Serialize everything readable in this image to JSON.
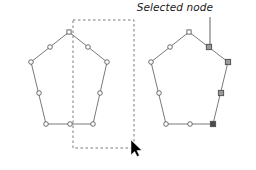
{
  "canvas": {
    "width": 256,
    "height": 170,
    "background": "#ffffff"
  },
  "figure": {
    "title_visible": false,
    "colors": {
      "path_stroke": "#6b6b6b",
      "node_stroke": "#555555",
      "node_fill_unselected": "#ffffff",
      "node_fill_selected": "#9a9a9a",
      "node_fill_active": "#4a4a4a",
      "marquee_stroke": "#555555",
      "leader_stroke": "#6f6f6f",
      "label_color": "#1a1a1a",
      "cursor_fill": "#000000"
    }
  },
  "annotation": {
    "label": "Selected node",
    "leader_line": {
      "from_x": 210,
      "from_y": 17,
      "to_x": 210,
      "to_y": 44
    },
    "label_x": 213,
    "label_y": 11
  },
  "left_shape": {
    "name": "pentagon-unselected",
    "vertices": [
      {
        "id": "v-top",
        "x": 69,
        "y": 32,
        "shape": "square",
        "state": "unselected"
      },
      {
        "id": "v-right-upper",
        "x": 107,
        "y": 62,
        "shape": "circle",
        "state": "unselected"
      },
      {
        "id": "v-right-lower",
        "x": 93,
        "y": 124,
        "shape": "circle",
        "state": "unselected"
      },
      {
        "id": "v-left-lower",
        "x": 46,
        "y": 124,
        "shape": "circle",
        "state": "unselected"
      },
      {
        "id": "v-left-upper",
        "x": 31,
        "y": 62,
        "shape": "circle",
        "state": "unselected"
      }
    ],
    "midpoints": [
      {
        "id": "m-top-right",
        "x": 88,
        "y": 47,
        "shape": "circle",
        "state": "unselected"
      },
      {
        "id": "m-right",
        "x": 100,
        "y": 93,
        "shape": "circle",
        "state": "unselected"
      },
      {
        "id": "m-bottom",
        "x": 70,
        "y": 124,
        "shape": "circle",
        "state": "unselected"
      },
      {
        "id": "m-left",
        "x": 39,
        "y": 93,
        "shape": "circle",
        "state": "unselected"
      },
      {
        "id": "m-top-left",
        "x": 50,
        "y": 47,
        "shape": "circle",
        "state": "unselected"
      }
    ]
  },
  "right_shape": {
    "name": "pentagon-selected",
    "vertices": [
      {
        "id": "v-top",
        "x": 189,
        "y": 32,
        "shape": "square",
        "state": "unselected"
      },
      {
        "id": "v-right-upper",
        "x": 228,
        "y": 62,
        "shape": "square",
        "state": "selected"
      },
      {
        "id": "v-right-lower",
        "x": 213,
        "y": 124,
        "shape": "square",
        "state": "active"
      },
      {
        "id": "v-left-lower",
        "x": 166,
        "y": 124,
        "shape": "circle",
        "state": "unselected"
      },
      {
        "id": "v-left-upper",
        "x": 151,
        "y": 62,
        "shape": "circle",
        "state": "unselected"
      }
    ],
    "midpoints": [
      {
        "id": "m-top-right",
        "x": 209,
        "y": 47,
        "shape": "square",
        "state": "selected"
      },
      {
        "id": "m-right",
        "x": 221,
        "y": 93,
        "shape": "square",
        "state": "selected"
      },
      {
        "id": "m-bottom",
        "x": 190,
        "y": 124,
        "shape": "circle",
        "state": "unselected"
      },
      {
        "id": "m-left",
        "x": 159,
        "y": 93,
        "shape": "circle",
        "state": "unselected"
      },
      {
        "id": "m-top-left",
        "x": 170,
        "y": 47,
        "shape": "circle",
        "state": "unselected"
      }
    ]
  },
  "marquee": {
    "name": "selection-marquee",
    "x": 73,
    "y": 20,
    "width": 61,
    "height": 128,
    "dash": "2.5 2.5"
  },
  "cursor": {
    "name": "mouse-cursor",
    "x": 131,
    "y": 140
  }
}
